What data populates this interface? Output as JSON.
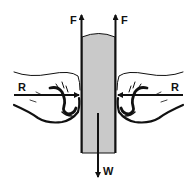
{
  "diagram": {
    "colors": {
      "ink": "#111111",
      "book_fill": "#d9d9d9",
      "book_lines": "#9a9a9a",
      "background": "#ffffff"
    },
    "forces": {
      "friction_left": {
        "label": "F",
        "direction": "up"
      },
      "friction_right": {
        "label": "F",
        "direction": "up"
      },
      "reaction_left": {
        "label": "R",
        "direction": "right"
      },
      "reaction_right": {
        "label": "R",
        "direction": "left"
      },
      "weight": {
        "label": "W",
        "direction": "down"
      }
    }
  }
}
